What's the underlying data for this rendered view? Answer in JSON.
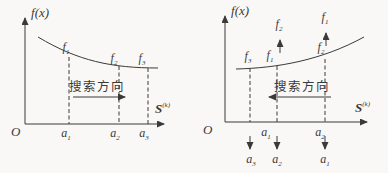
{
  "colors": {
    "background": "#f9f8f6",
    "ink": "#3a3a3a"
  },
  "figure": {
    "left_panel": {
      "y_axis_label": {
        "base": "f",
        "arg": "(x)"
      },
      "origin_label": "O",
      "x_axis_label": {
        "base": "S",
        "sup": "(k)"
      },
      "search_direction_label": "搜索方向",
      "curve_point_labels": [
        {
          "base": "f",
          "sub": "1"
        },
        {
          "base": "f",
          "sub": "2"
        },
        {
          "base": "f",
          "sub": "3"
        }
      ],
      "axis_point_labels": [
        {
          "base": "a",
          "sub": "1"
        },
        {
          "base": "a",
          "sub": "2"
        },
        {
          "base": "a",
          "sub": "3"
        }
      ]
    },
    "right_panel": {
      "y_axis_label": {
        "base": "f",
        "arg": "(x)"
      },
      "origin_label": "O",
      "x_axis_label": {
        "base": "S",
        "sup": "(k)"
      },
      "search_direction_label": "搜索方向",
      "raised_value_labels": [
        {
          "base": "f",
          "sub": "2"
        },
        {
          "base": "f",
          "sub": "1"
        }
      ],
      "curve_point_labels": [
        {
          "base": "f",
          "sub": "3"
        },
        {
          "base": "f",
          "sub": "1"
        },
        {
          "base": "f",
          "sub": "2"
        }
      ],
      "axis_point_labels": [
        {
          "base": "a",
          "sub": "1"
        },
        {
          "base": "a",
          "sub": "2"
        }
      ],
      "relabel_point_labels": [
        {
          "base": "a",
          "sub": "3"
        },
        {
          "base": "a",
          "sub": "2"
        },
        {
          "base": "a",
          "sub": "1"
        }
      ]
    }
  }
}
